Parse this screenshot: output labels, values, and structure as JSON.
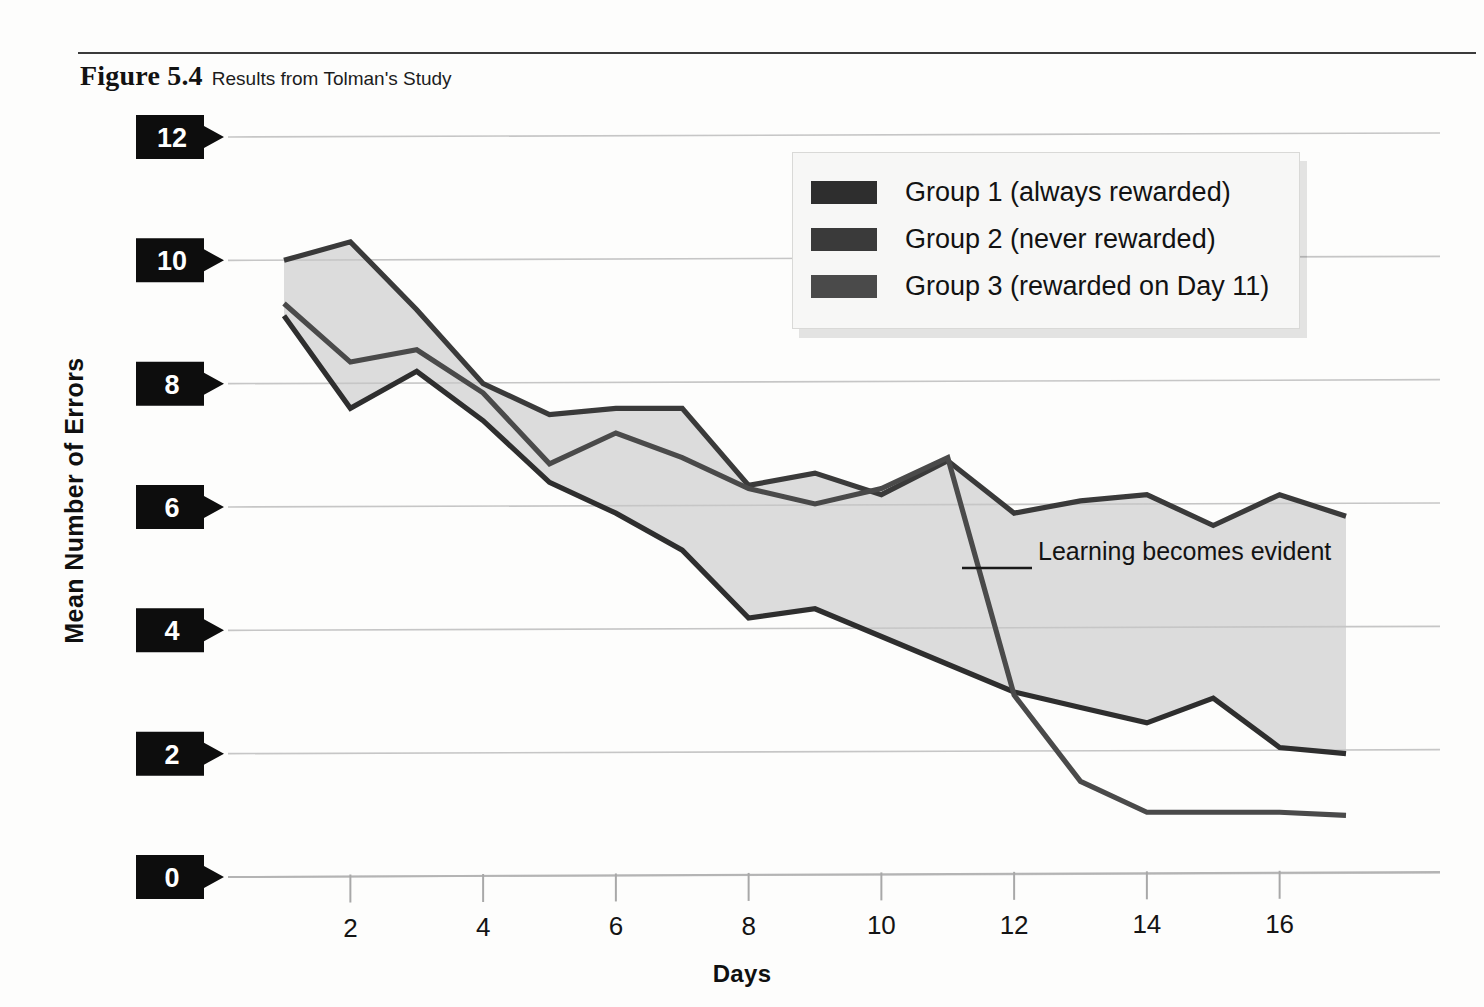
{
  "figure": {
    "number_label": "Figure 5.4",
    "caption": "Results from Tolman's Study"
  },
  "annotation": {
    "text": "Learning becomes evident"
  },
  "legend": {
    "position": "top-right",
    "entries": [
      {
        "label": "Group 1 (always rewarded)",
        "color": "#2e2e2e"
      },
      {
        "label": "Group 2 (never rewarded)",
        "color": "#3a3a3a"
      },
      {
        "label": "Group 3 (rewarded on Day 11)",
        "color": "#4a4a4a"
      }
    ]
  },
  "chart_data": {
    "type": "line",
    "title": "Results from Tolman's Study",
    "xlabel": "Days",
    "ylabel": "Mean Number of Errors",
    "xlim": [
      1,
      17
    ],
    "ylim": [
      0,
      12
    ],
    "xticks": [
      2,
      4,
      6,
      8,
      10,
      12,
      14,
      16
    ],
    "yticks": [
      0,
      2,
      4,
      6,
      8,
      10,
      12
    ],
    "grid": true,
    "x": [
      1,
      2,
      3,
      4,
      5,
      6,
      7,
      8,
      9,
      10,
      11,
      12,
      13,
      14,
      15,
      16,
      17
    ],
    "series": [
      {
        "name": "Group 1 (always rewarded)",
        "color": "#2e2e2e",
        "values": [
          9.1,
          7.6,
          8.2,
          7.4,
          6.4,
          5.9,
          5.3,
          4.2,
          4.35,
          3.9,
          3.45,
          3.0,
          2.75,
          2.5,
          2.9,
          2.1,
          2.0
        ]
      },
      {
        "name": "Group 2 (never rewarded)",
        "color": "#3a3a3a",
        "values": [
          10.0,
          10.3,
          9.2,
          8.0,
          7.5,
          7.6,
          7.6,
          6.35,
          6.55,
          6.2,
          6.75,
          5.9,
          6.1,
          6.2,
          5.7,
          6.2,
          5.85
        ]
      },
      {
        "name": "Group 3 (rewarded on Day 11)",
        "color": "#4a4a4a",
        "values": [
          9.3,
          8.35,
          8.55,
          7.85,
          6.7,
          7.2,
          6.8,
          6.3,
          6.05,
          6.3,
          6.8,
          2.95,
          1.55,
          1.05,
          1.05,
          1.05,
          1.0
        ]
      }
    ],
    "band_fill": "#dcdcdc",
    "band_note": "shaded area between Group 2 (upper) and Group 1 (lower)"
  }
}
